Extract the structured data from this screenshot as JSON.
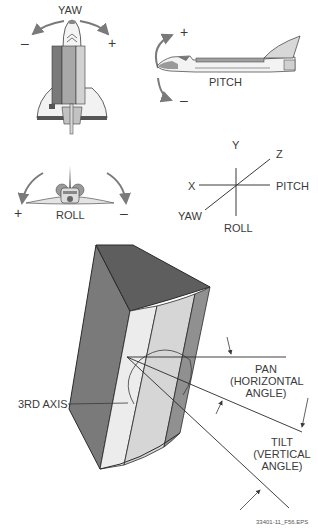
{
  "yaw_view": {
    "title": "YAW",
    "minus_sign": "–",
    "plus_sign": "+"
  },
  "pitch_view": {
    "title": "PITCH",
    "plus_sign": "+",
    "minus_sign": "–"
  },
  "roll_view": {
    "title": "ROLL",
    "plus_sign": "+",
    "minus_sign": "–"
  },
  "axes": {
    "y_label": "Y",
    "z_label": "Z",
    "x_label": "X",
    "pitch_label": "PITCH",
    "yaw_label": "YAW",
    "roll_label": "ROLL"
  },
  "block_diagram": {
    "third_axis_label": "3RD AXIS",
    "pan_label": "PAN",
    "pan_sub1": "(HORIZONTAL",
    "pan_sub2": "ANGLE)",
    "tilt_label": "TILT",
    "tilt_sub1": "(VERTICAL",
    "tilt_sub2": "ANGLE)"
  },
  "figure_id": "33401-11_F56.EPS",
  "colors": {
    "line": "#3a3a3a",
    "arrow": "#7a7a7a",
    "dark_face": "#6e6e6e",
    "mid_face": "#8f8f8f",
    "light_face": "#e6e6e6",
    "lighter_face": "#d2d2d2",
    "top_face": "#5e5e5e"
  }
}
